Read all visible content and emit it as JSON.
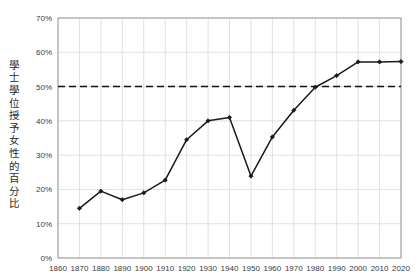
{
  "chart_data": {
    "type": "line",
    "title": "",
    "xlabel": "",
    "ylabel": "學士學位授予女性的百分比",
    "xlim": [
      1860,
      2020
    ],
    "ylim": [
      0,
      70
    ],
    "grid": true,
    "legend": "none",
    "x_ticks": [
      1860,
      1870,
      1880,
      1890,
      1900,
      1910,
      1920,
      1930,
      1940,
      1950,
      1960,
      1970,
      1980,
      1990,
      2000,
      2010,
      2020
    ],
    "x_tick_labels": [
      "1860",
      "1870",
      "1880",
      "1890",
      "1900",
      "1910",
      "1920",
      "1930",
      "1940",
      "1950",
      "1960",
      "1970",
      "1980",
      "1990",
      "2000",
      "2010",
      "2020"
    ],
    "y_ticks": [
      0,
      10,
      20,
      30,
      40,
      50,
      60,
      70
    ],
    "y_tick_labels": [
      "0%",
      "10%",
      "20%",
      "30%",
      "40%",
      "50%",
      "60%",
      "70%"
    ],
    "x": [
      1870,
      1880,
      1890,
      1900,
      1910,
      1920,
      1930,
      1940,
      1950,
      1960,
      1970,
      1980,
      1990,
      2000,
      2010,
      2020
    ],
    "values": [
      14.5,
      19.5,
      17.0,
      19.0,
      22.7,
      34.5,
      40.0,
      41.0,
      23.9,
      35.3,
      43.1,
      49.8,
      53.2,
      57.2,
      57.2,
      57.3
    ],
    "series": [
      {
        "name": "學士學位授予女性的百分比",
        "color": "#1a1a1a",
        "marker": "diamond",
        "values": [
          14.5,
          19.5,
          17.0,
          19.0,
          22.7,
          34.5,
          40.0,
          41.0,
          23.9,
          35.3,
          43.1,
          49.8,
          53.2,
          57.2,
          57.2,
          57.3
        ]
      }
    ],
    "reference_lines": [
      {
        "name": "parity-50-percent",
        "axis": "y",
        "value": 50,
        "style": "dashed",
        "color": "#111111"
      }
    ],
    "colors": {
      "line": "#1a1a1a",
      "marker": "#111111",
      "grid": "#d9d9d9",
      "axis": "#9a9a9a",
      "background": "#ffffff",
      "tick_label": "#3a3a3a",
      "axis_label": "#2b2b2b"
    }
  }
}
